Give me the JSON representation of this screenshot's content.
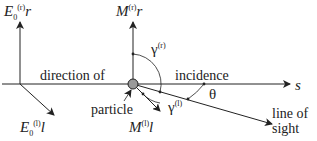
{
  "labels": {
    "e0r": {
      "base": "E",
      "sub": "0",
      "sup": "(r)",
      "vec": "r"
    },
    "mr": {
      "base": "M",
      "sup": "(r)",
      "vec": "r"
    },
    "e0l": {
      "base": "E",
      "sub": "0",
      "sup": "(l)",
      "vec": "l"
    },
    "ml": {
      "base": "M",
      "sup": "(l)",
      "vec": "l"
    },
    "gamma_r": {
      "base": "γ",
      "sup": "(r)"
    },
    "gamma_l": {
      "base": "γ",
      "sup": "(l)"
    },
    "theta": "θ",
    "s_vec": "s",
    "direction_of": "direction of",
    "incidence": "incidence",
    "particle": "particle",
    "line_of": "line of",
    "sight": "sight"
  },
  "colors": {
    "line": "#222222",
    "particle_fill": "#9a9a9a"
  }
}
